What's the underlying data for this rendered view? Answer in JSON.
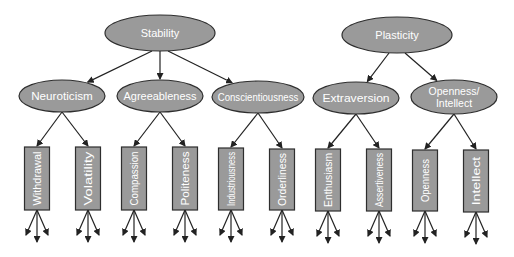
{
  "diagram": {
    "colors": {
      "node_fill": "#9a9a9a",
      "node_stroke": "#2e2e2e",
      "text": "#ffffff",
      "edge": "#222222",
      "background": "#ffffff"
    },
    "metatraits": [
      {
        "id": "stability",
        "label": "Stability",
        "cx": 160,
        "cy": 33,
        "rx": 55,
        "ry": 18,
        "children": [
          "neuroticism",
          "agreeableness",
          "conscientiousness"
        ]
      },
      {
        "id": "plasticity",
        "label": "Plasticity",
        "cx": 397,
        "cy": 35,
        "rx": 55,
        "ry": 18,
        "children": [
          "extraversion",
          "openness_intellect"
        ]
      }
    ],
    "traits": [
      {
        "id": "neuroticism",
        "label": "Neuroticism",
        "lines": [
          "Neuroticism"
        ],
        "cx": 62,
        "cy": 96,
        "rx": 43,
        "ry": 16,
        "aspects": [
          "withdrawal",
          "volatility"
        ]
      },
      {
        "id": "agreeableness",
        "label": "Agreeableness",
        "lines": [
          "Agreeableness"
        ],
        "cx": 160,
        "cy": 96,
        "rx": 43,
        "ry": 16,
        "aspects": [
          "compassion",
          "politeness"
        ]
      },
      {
        "id": "conscientiousness",
        "label": "Conscientiousness",
        "lines": [
          "Conscientiousness"
        ],
        "cx": 258,
        "cy": 97,
        "rx": 46,
        "ry": 16,
        "aspects": [
          "industriousness",
          "orderliness"
        ]
      },
      {
        "id": "extraversion",
        "label": "Extraversion",
        "lines": [
          "Extraversion"
        ],
        "cx": 356,
        "cy": 98,
        "rx": 43,
        "ry": 16,
        "aspects": [
          "enthusiasm",
          "assertiveness"
        ]
      },
      {
        "id": "openness_intellect",
        "label": "Openness/ Intellect",
        "lines": [
          "Openness/",
          "Intellect"
        ],
        "cx": 454,
        "cy": 97,
        "rx": 43,
        "ry": 17,
        "aspects": [
          "openness",
          "intellect"
        ]
      }
    ],
    "aspects": [
      {
        "id": "withdrawal",
        "label": "Withdrawal",
        "cx": 37,
        "top": 147,
        "bottom": 210,
        "width": 25
      },
      {
        "id": "volatility",
        "label": "Volatility",
        "cx": 88,
        "top": 147,
        "bottom": 210,
        "width": 25
      },
      {
        "id": "compassion",
        "label": "Compassion",
        "cx": 134,
        "top": 147,
        "bottom": 210,
        "width": 25
      },
      {
        "id": "politeness",
        "label": "Politeness",
        "cx": 185,
        "top": 147,
        "bottom": 210,
        "width": 25
      },
      {
        "id": "industriousness",
        "label": "Industriousness",
        "cx": 231,
        "top": 148,
        "bottom": 210,
        "width": 25
      },
      {
        "id": "orderliness",
        "label": "Orderliness",
        "cx": 282,
        "top": 149,
        "bottom": 210,
        "width": 25
      },
      {
        "id": "enthusiasm",
        "label": "Enthusiasm",
        "cx": 328,
        "top": 149,
        "bottom": 211,
        "width": 25
      },
      {
        "id": "assertiveness",
        "label": "Assertiveness",
        "cx": 379,
        "top": 149,
        "bottom": 211,
        "width": 25
      },
      {
        "id": "openness",
        "label": "Openness",
        "cx": 425,
        "top": 150,
        "bottom": 211,
        "width": 25
      },
      {
        "id": "intellect",
        "label": "Intellect",
        "cx": 476,
        "top": 150,
        "bottom": 212,
        "width": 25
      }
    ],
    "fanout_arrows_per_aspect": 3
  }
}
